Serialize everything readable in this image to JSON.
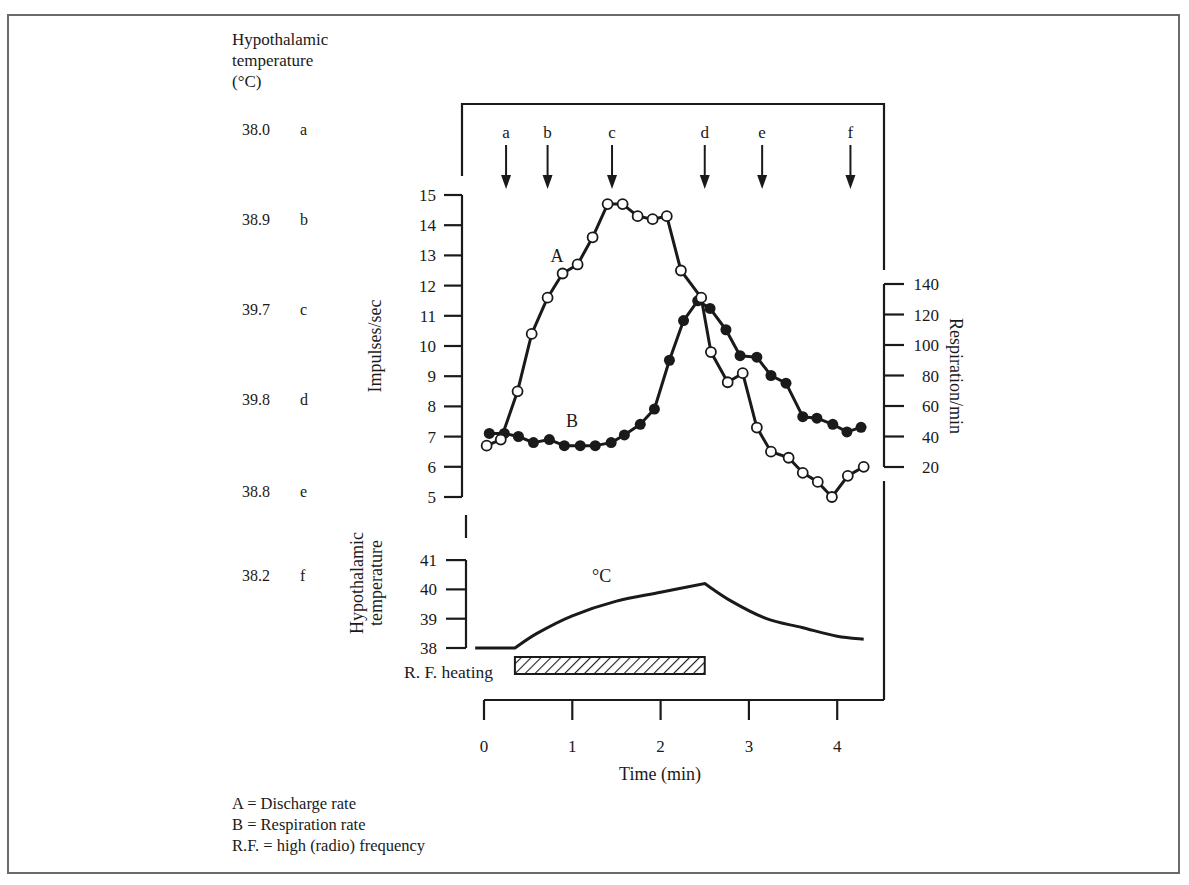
{
  "figure": {
    "left_panel": {
      "title_lines": [
        "Hypothalamic",
        "temperature",
        "(°C)"
      ],
      "rows": [
        {
          "value": "38.0",
          "label": "a"
        },
        {
          "value": "38.9",
          "label": "b"
        },
        {
          "value": "39.7",
          "label": "c"
        },
        {
          "value": "39.8",
          "label": "d"
        },
        {
          "value": "38.8",
          "label": "e"
        },
        {
          "value": "38.2",
          "label": "f"
        }
      ]
    },
    "markers": [
      "a",
      "b",
      "c",
      "d",
      "e",
      "f"
    ],
    "series_labels": {
      "A": "A",
      "B": "B"
    },
    "lower_panel": {
      "ylabel_lines": [
        "Hypothalamic",
        "temperature"
      ],
      "unit_label": "°C",
      "heating_label": "R. F. heating"
    },
    "legend": [
      "A = Discharge rate",
      "B = Respiration rate",
      "R.F. = high (radio) frequency"
    ]
  },
  "chart_data": [
    {
      "type": "line",
      "title": "Discharge rate (A) and respiration rate (B) during R.F. hypothalamic heating",
      "xlabel": "Time (min)",
      "x_ticks": [
        0,
        1,
        2,
        3,
        4
      ],
      "xlim": [
        0,
        4.3
      ],
      "y_left": {
        "label": "Impulses/sec",
        "ticks": [
          5,
          6,
          7,
          8,
          9,
          10,
          11,
          12,
          13,
          14,
          15
        ],
        "range": [
          5,
          15
        ]
      },
      "y_right": {
        "label": "Respiration/min",
        "ticks": [
          20,
          40,
          60,
          80,
          100,
          120,
          140
        ],
        "range": [
          20,
          140
        ]
      },
      "event_markers": [
        {
          "label": "a",
          "time": 0.25
        },
        {
          "label": "b",
          "time": 0.72
        },
        {
          "label": "c",
          "time": 1.45
        },
        {
          "label": "d",
          "time": 2.5
        },
        {
          "label": "e",
          "time": 3.15
        },
        {
          "label": "f",
          "time": 4.15
        }
      ],
      "series": [
        {
          "name": "A",
          "description": "Discharge rate (Impulses/sec), open circles",
          "axis": "left",
          "marker": "open-circle",
          "x": [
            0.03,
            0.19,
            0.38,
            0.54,
            0.72,
            0.89,
            1.06,
            1.23,
            1.4,
            1.57,
            1.74,
            1.91,
            2.07,
            2.23,
            2.46,
            2.57,
            2.76,
            2.93,
            3.09,
            3.25,
            3.45,
            3.61,
            3.78,
            3.94,
            4.12,
            4.3
          ],
          "y": [
            6.7,
            6.9,
            8.5,
            10.4,
            11.6,
            12.4,
            12.7,
            13.6,
            14.7,
            14.7,
            14.3,
            14.2,
            14.3,
            12.5,
            11.6,
            9.8,
            8.8,
            9.1,
            7.3,
            6.5,
            6.3,
            5.8,
            5.5,
            5.0,
            5.7,
            6.0
          ]
        },
        {
          "name": "B",
          "description": "Respiration rate (Respiration/min), filled circles",
          "axis": "right",
          "marker": "filled-circle",
          "x": [
            0.06,
            0.23,
            0.39,
            0.56,
            0.74,
            0.91,
            1.09,
            1.26,
            1.44,
            1.59,
            1.77,
            1.93,
            2.1,
            2.26,
            2.42,
            2.56,
            2.74,
            2.9,
            3.09,
            3.25,
            3.42,
            3.61,
            3.77,
            3.95,
            4.11,
            4.27
          ],
          "y": [
            42,
            42,
            40,
            36,
            38,
            34,
            34,
            34,
            36,
            41,
            48,
            58,
            90,
            116,
            129,
            124,
            110,
            93,
            92,
            80,
            75,
            53,
            52,
            48,
            43,
            46
          ]
        },
        {
          "name": "Hypothalamic temperature",
          "description": "Lower panel, °C",
          "axis": "lower",
          "y_ticks": [
            38,
            39,
            40,
            41
          ],
          "x": [
            -0.1,
            0.35,
            0.6,
            1.0,
            1.5,
            2.0,
            2.5,
            2.8,
            3.2,
            3.6,
            4.0,
            4.3
          ],
          "y": [
            38.0,
            38.0,
            38.5,
            39.1,
            39.6,
            39.9,
            40.2,
            39.6,
            39.0,
            38.7,
            38.4,
            38.3
          ]
        }
      ],
      "rf_heating": {
        "start": 0.35,
        "end": 2.5
      }
    }
  ]
}
